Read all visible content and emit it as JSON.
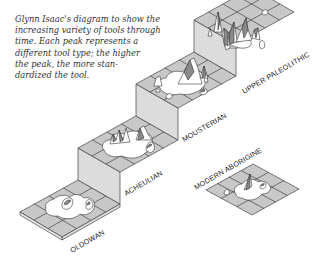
{
  "caption": {
    "lines": [
      "Glynn Isaac's diagram to show the",
      "increasing variety of tools through",
      "time. Each peak represents a",
      "different tool type; the higher",
      "the peak, the more stan-",
      "dardized the tool."
    ]
  },
  "stages": [
    {
      "label": "OLDOWAN",
      "level": 1
    },
    {
      "label": "ACHEULIAN",
      "level": 2
    },
    {
      "label": "MOUSTERIAN",
      "level": 3
    },
    {
      "label": "UPPER PALEOLITHIC",
      "level": 4
    },
    {
      "label": "MODERN ABORIGINE",
      "level": 0
    }
  ],
  "colors": {
    "tile": "#c8c8c8",
    "tile_line": "#444444",
    "riser": "#dcdcdc",
    "peak_fill": "#ffffff",
    "peak_shade": "#8a8a8a",
    "ink": "#222222"
  }
}
